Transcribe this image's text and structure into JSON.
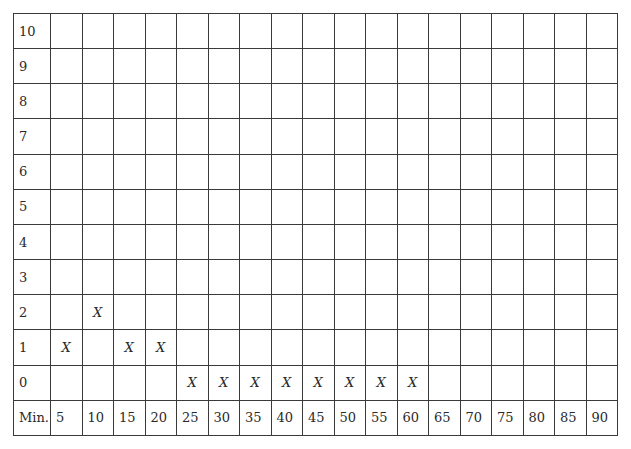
{
  "chart_data": {
    "type": "table",
    "title": "",
    "xlabel": "Min.",
    "ylabel": "",
    "x": [
      5,
      10,
      15,
      20,
      25,
      30,
      35,
      40,
      45,
      50,
      55,
      60,
      65,
      70,
      75,
      80,
      85,
      90
    ],
    "y_levels": [
      10,
      9,
      8,
      7,
      6,
      5,
      4,
      3,
      2,
      1,
      0
    ],
    "values": [
      1,
      2,
      1,
      1,
      0,
      0,
      0,
      0,
      0,
      0,
      0,
      0,
      null,
      null,
      null,
      null,
      null,
      null
    ],
    "marker": "X",
    "ylim": [
      0,
      10
    ],
    "grid": true
  }
}
